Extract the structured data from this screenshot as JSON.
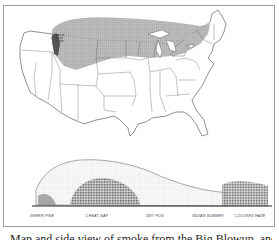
{
  "figure": {
    "map": {
      "description": "Outline map of the United States with shaded band across northern states",
      "shaded_region_color": "#a8a8a8",
      "inset_label": "area of dense smoke"
    },
    "cross_section": {
      "labels": [
        "GREEN PINE",
        "CHEAT GAP",
        "DRY FOG",
        "INDIAN SUMMER",
        "COLORED HAZE"
      ]
    },
    "caption": "Map and side view of smoke from the Big Blowup, and"
  }
}
